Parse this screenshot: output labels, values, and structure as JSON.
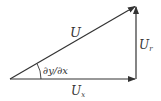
{
  "diagram": {
    "type": "vector-decomposition",
    "colors": {
      "stroke": "#333333",
      "background": "#ffffff"
    },
    "labels": {
      "resultant": "U",
      "resultant_display": "U",
      "x_component_main": "U",
      "x_component_sub": "x",
      "y_component_main": "U",
      "y_component_sub": "r",
      "angle": "∂y/∂x"
    },
    "vectors": [
      {
        "name": "resultant",
        "from": [
          10,
          79
        ],
        "to": [
          136,
          6
        ]
      },
      {
        "name": "x-component",
        "from": [
          10,
          79
        ],
        "to": [
          136,
          79
        ]
      },
      {
        "name": "y-component",
        "from": [
          136,
          79
        ],
        "to": [
          136,
          6
        ]
      }
    ]
  }
}
